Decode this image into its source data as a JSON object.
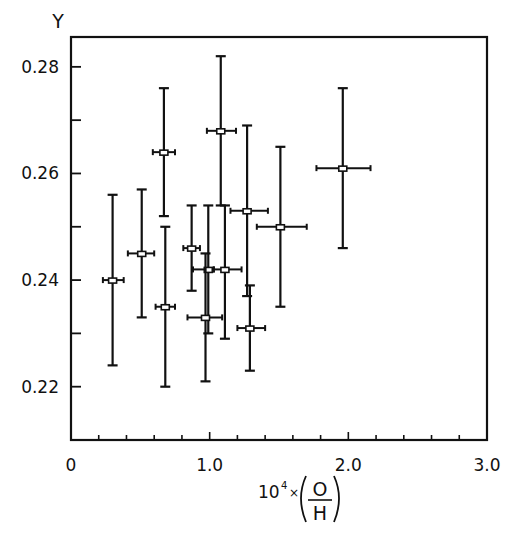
{
  "chart_data": {
    "type": "scatter",
    "title": "",
    "xlabel": "10^4 × (O/H)",
    "ylabel": "Y",
    "xlim": [
      0,
      3.0
    ],
    "ylim": [
      0.21,
      0.2856
    ],
    "x_ticks": [
      0,
      1.0,
      2.0,
      3.0
    ],
    "x_tick_labels": [
      "0",
      "1.0",
      "2.0",
      "3.0"
    ],
    "x_minor_step": 0.2,
    "y_ticks": [
      0.22,
      0.24,
      0.26,
      0.28
    ],
    "y_tick_labels": [
      "0.22",
      "0.24",
      "0.26",
      "0.28"
    ],
    "y_minor_step": 0.01,
    "grid": false,
    "legend": null,
    "series": [
      {
        "name": "Y vs O/H",
        "marker": "open-square",
        "points": [
          {
            "x": 0.3,
            "y": 0.24,
            "y_low": 0.224,
            "y_high": 0.256,
            "x_low": 0.23,
            "x_high": 0.38
          },
          {
            "x": 0.51,
            "y": 0.245,
            "y_low": 0.233,
            "y_high": 0.257,
            "x_low": 0.41,
            "x_high": 0.6
          },
          {
            "x": 0.67,
            "y": 0.264,
            "y_low": 0.252,
            "y_high": 0.276,
            "x_low": 0.59,
            "x_high": 0.75
          },
          {
            "x": 0.68,
            "y": 0.235,
            "y_low": 0.22,
            "y_high": 0.25,
            "x_low": 0.61,
            "x_high": 0.75
          },
          {
            "x": 0.87,
            "y": 0.246,
            "y_low": 0.238,
            "y_high": 0.254,
            "x_low": 0.81,
            "x_high": 0.93
          },
          {
            "x": 0.99,
            "y": 0.242,
            "y_low": 0.23,
            "y_high": 0.254,
            "x_low": 0.88,
            "x_high": 1.03
          },
          {
            "x": 0.97,
            "y": 0.233,
            "y_low": 0.221,
            "y_high": 0.245,
            "x_low": 0.84,
            "x_high": 1.09
          },
          {
            "x": 1.08,
            "y": 0.268,
            "y_low": 0.254,
            "y_high": 0.282,
            "x_low": 0.98,
            "x_high": 1.19
          },
          {
            "x": 1.11,
            "y": 0.242,
            "y_low": 0.229,
            "y_high": 0.254,
            "x_low": 1.03,
            "x_high": 1.23
          },
          {
            "x": 1.27,
            "y": 0.253,
            "y_low": 0.237,
            "y_high": 0.269,
            "x_low": 1.15,
            "x_high": 1.42
          },
          {
            "x": 1.29,
            "y": 0.231,
            "y_low": 0.223,
            "y_high": 0.239,
            "x_low": 1.2,
            "x_high": 1.4
          },
          {
            "x": 1.51,
            "y": 0.25,
            "y_low": 0.235,
            "y_high": 0.265,
            "x_low": 1.34,
            "x_high": 1.7
          },
          {
            "x": 1.96,
            "y": 0.261,
            "y_low": 0.246,
            "y_high": 0.276,
            "x_low": 1.77,
            "x_high": 2.16
          }
        ]
      }
    ]
  },
  "labels": {
    "y_axis_title": "Y",
    "x_axis_prefix": "10",
    "x_axis_exponent": "4",
    "x_axis_times": "×",
    "x_axis_numerator": "O",
    "x_axis_denominator": "H"
  }
}
